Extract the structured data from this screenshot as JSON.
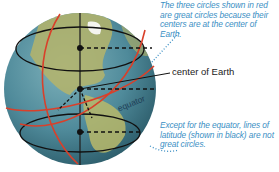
{
  "captions": {
    "great_circles": "The three circles shown in red are great circles because their centers are at the center of Earth.",
    "latitude": "Except for the equator, lines of latitude (shown in black) are not great circles."
  },
  "labels": {
    "center": "center of Earth",
    "equator": "equator"
  },
  "colors": {
    "great_circle": "#d9402a",
    "latitude_line": "#111111",
    "caption_text": "#3b8fc4",
    "ocean": "#4f8a9a",
    "land": "#b9b86a"
  }
}
